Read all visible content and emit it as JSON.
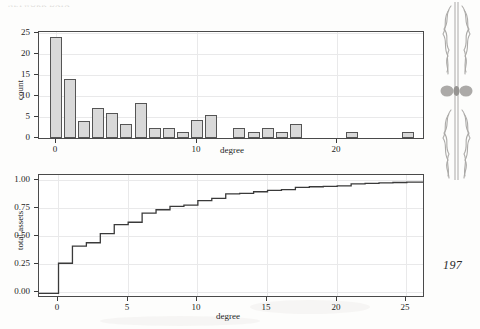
{
  "page": {
    "folio": "197",
    "running_head": "NETWORK DATA",
    "ornament_name": "decorative-fleuron"
  },
  "chart_data": [
    {
      "type": "bar",
      "name": "degree-histogram",
      "title": "",
      "xlabel": "degree",
      "ylabel": "count",
      "xlim": [
        -1.2,
        26.2
      ],
      "ylim": [
        0,
        25.6
      ],
      "xticks": [
        0,
        10,
        20
      ],
      "yticks": [
        0,
        5,
        10,
        15,
        20,
        25
      ],
      "grid": true,
      "categories": [
        0,
        1,
        2,
        3,
        4,
        5,
        6,
        7,
        8,
        9,
        10,
        11,
        12,
        13,
        14,
        15,
        16,
        17,
        18,
        19,
        20,
        21,
        22,
        23,
        24,
        25
      ],
      "values": [
        24,
        14,
        4,
        7,
        6,
        3.2,
        8.2,
        2.2,
        2.2,
        1.2,
        4.2,
        5.3,
        0,
        2.2,
        1.2,
        2.2,
        1.2,
        3.0,
        0,
        0,
        0,
        1.2,
        0,
        0,
        0,
        1.2
      ]
    },
    {
      "type": "line",
      "name": "total-assets-ecdf",
      "title": "",
      "xlabel": "degree",
      "ylabel": "total assets",
      "xlim": [
        -1.4,
        26.3
      ],
      "ylim": [
        -0.04,
        1.04
      ],
      "xticks": [
        0,
        5,
        10,
        15,
        20,
        25
      ],
      "yticks": [
        0.0,
        0.25,
        0.5,
        0.75,
        1.0
      ],
      "ytick_labels": [
        "0.00",
        "0.25",
        "0.50",
        "0.75",
        "1.00"
      ],
      "grid": true,
      "step": "post",
      "x": [
        -1.4,
        0,
        1,
        2,
        3,
        4,
        5,
        6,
        7,
        8,
        9,
        10,
        11,
        12,
        13,
        14,
        15,
        16,
        17,
        18,
        19,
        20,
        21,
        22,
        23,
        24,
        25,
        26.3
      ],
      "y": [
        0.0,
        0.265,
        0.415,
        0.445,
        0.525,
        0.605,
        0.625,
        0.705,
        0.735,
        0.765,
        0.775,
        0.815,
        0.835,
        0.875,
        0.878,
        0.893,
        0.905,
        0.912,
        0.932,
        0.937,
        0.941,
        0.945,
        0.962,
        0.966,
        0.97,
        0.974,
        0.978,
        1.0
      ]
    }
  ]
}
